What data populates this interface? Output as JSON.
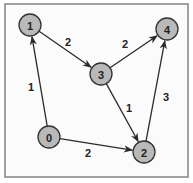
{
  "diagram": {
    "type": "directed-weighted-graph",
    "colors": {
      "node_fill": "#b9b9b9",
      "node_stroke": "#333333",
      "edge": "#2a2a2a",
      "frame": "#8a8a8a"
    },
    "nodes": [
      {
        "id": "0",
        "label": "0"
      },
      {
        "id": "1",
        "label": "1"
      },
      {
        "id": "2",
        "label": "2"
      },
      {
        "id": "3",
        "label": "3"
      },
      {
        "id": "4",
        "label": "4"
      }
    ],
    "edges": [
      {
        "from": "0",
        "to": "1",
        "weight": "1"
      },
      {
        "from": "0",
        "to": "2",
        "weight": "2"
      },
      {
        "from": "1",
        "to": "3",
        "weight": "2"
      },
      {
        "from": "3",
        "to": "4",
        "weight": "2"
      },
      {
        "from": "3",
        "to": "2",
        "weight": "1"
      },
      {
        "from": "2",
        "to": "4",
        "weight": "3"
      }
    ]
  }
}
